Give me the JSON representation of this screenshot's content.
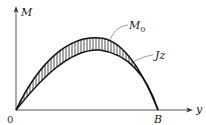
{
  "diagram": {
    "axes": {
      "vertical_label": "M",
      "horizontal_label": "y",
      "origin_label": "0",
      "end_label": "B"
    },
    "curves": [
      {
        "name": "M0",
        "label_main": "M",
        "label_sub": "0"
      },
      {
        "name": "Jz",
        "label_main": "Jz"
      }
    ],
    "colors": {
      "ink": "#222222",
      "background": "#ffffff"
    }
  }
}
